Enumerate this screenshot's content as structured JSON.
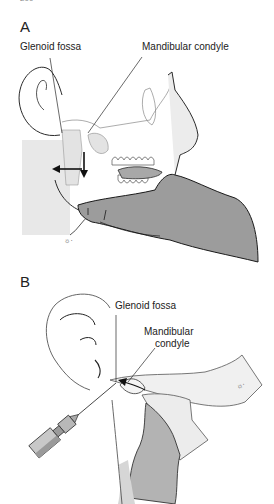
{
  "header": {
    "page_fragment": "200",
    "running_title_fragment": "..."
  },
  "figure": {
    "panels": [
      {
        "label": "A",
        "callouts": [
          {
            "id": "glenoid-fossa",
            "text": "Glenoid fossa"
          },
          {
            "id": "mandibular-condyle",
            "text": "Mandibular condyle"
          }
        ],
        "arrows": [
          "left-arrow",
          "down-arrow"
        ],
        "signature": "☼·"
      },
      {
        "label": "B",
        "callouts": [
          {
            "id": "glenoid-fossa",
            "text": "Glenoid fossa"
          },
          {
            "id": "mandibular-condyle-line1",
            "text": "Mandibular"
          },
          {
            "id": "mandibular-condyle-line2",
            "text": "condyle"
          }
        ],
        "signature": "☼·"
      }
    ],
    "colors": {
      "line": "#2a2a2a",
      "hand_fill": "#9a9a9a",
      "light_fill": "#e6e6e6",
      "mid_fill": "#b8b8b8",
      "background": "#ffffff"
    }
  }
}
